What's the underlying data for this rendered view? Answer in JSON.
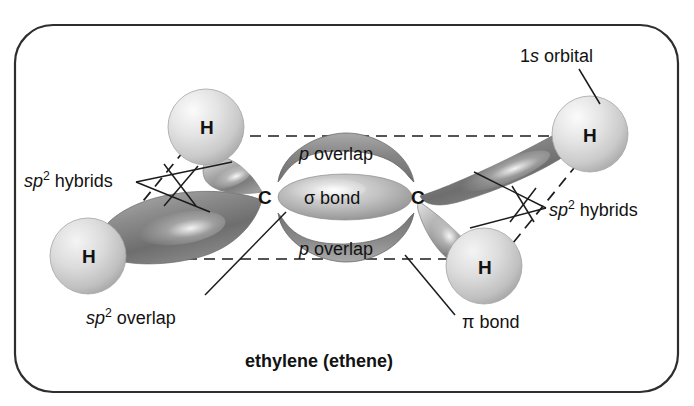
{
  "figure": {
    "caption": "ethylene (ethene)",
    "border_color": "#2e2e2e",
    "background_color": "#ffffff",
    "ink_color": "#121212"
  },
  "annotations": {
    "s_orbital": {
      "prefix": "1",
      "italic": "s",
      "suffix": " orbital"
    },
    "p_overlap_top": {
      "italic": "p",
      "suffix": " overlap"
    },
    "p_overlap_bottom": {
      "italic": "p",
      "suffix": " overlap"
    },
    "sigma_bond": {
      "text": "σ bond"
    },
    "pi_bond": {
      "text": "π bond"
    },
    "sp2_hybrids_left": {
      "italic": "sp",
      "sup": "2",
      "suffix": " hybrids"
    },
    "sp2_hybrids_right": {
      "italic": "sp",
      "sup": "2",
      "suffix": " hybrids"
    },
    "sp2_overlap": {
      "italic": "sp",
      "sup": "2",
      "suffix": " overlap"
    }
  },
  "atoms": [
    {
      "id": "carbon-left",
      "symbol": "C",
      "x": 264,
      "y": 197
    },
    {
      "id": "carbon-right",
      "symbol": "C",
      "x": 417,
      "y": 197
    },
    {
      "id": "hydrogen-top-left",
      "symbol": "H",
      "x": 206,
      "y": 128
    },
    {
      "id": "hydrogen-bottom-left",
      "symbol": "H",
      "x": 88,
      "y": 256
    },
    {
      "id": "hydrogen-top-right",
      "symbol": "H",
      "x": 588,
      "y": 135
    },
    {
      "id": "hydrogen-bottom-right",
      "symbol": "H",
      "x": 483,
      "y": 267
    }
  ],
  "colors": {
    "sphere_light": "#f2f2f2",
    "sphere_mid": "#cfcfcf",
    "sphere_edge": "#a8a8a8",
    "lobe_light": "#e6e6e6",
    "lobe_mid": "#9a9a9a",
    "lobe_dark": "#707070",
    "pi_lobe": "#8d8d8d",
    "sigma_lobe": "#b5b5b5",
    "dashed_line": "#1c1c1c",
    "leader_line": "#1c1c1c"
  }
}
